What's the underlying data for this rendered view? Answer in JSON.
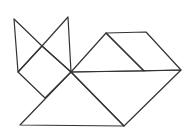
{
  "figure": {
    "stroke_color": "#333333",
    "background": "#ffffff",
    "points": {
      "left_ear_tip": [
        14,
        19
      ],
      "right_ear_tip": [
        68,
        17
      ],
      "ear_cross": [
        42,
        46
      ],
      "head_left": [
        18,
        72
      ],
      "neck": [
        71,
        72
      ],
      "head_bottom": [
        45,
        98
      ],
      "base_left": [
        20,
        125
      ],
      "base_right": [
        124,
        126
      ],
      "tail_right": [
        181,
        70
      ],
      "back_top_left": [
        106,
        33
      ],
      "back_top_right": [
        146,
        32
      ],
      "back_inner": [
        144,
        71
      ]
    },
    "pieces": [
      {
        "name": "left-ear-triangle",
        "points": "14,19 18,72 42,46"
      },
      {
        "name": "right-ear-triangle",
        "points": "68,17 71,72 42,46"
      },
      {
        "name": "head-square",
        "points": "42,46 71,72 45,98 18,72"
      },
      {
        "name": "body-large-triangle",
        "points": "20,125 124,126 71,72"
      },
      {
        "name": "body-parallelogram",
        "points": "71,72 181,70 124,126"
      },
      {
        "name": "back-triangle",
        "points": "71,72 106,33 144,71"
      },
      {
        "name": "back-parallelogram",
        "points": "106,33 146,32 181,70 144,71"
      }
    ]
  }
}
